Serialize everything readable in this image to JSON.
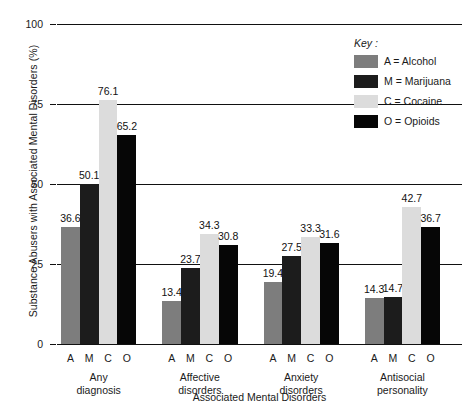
{
  "chart_data": {
    "type": "bar",
    "title": "",
    "xlabel": "Associated Mental Disorders",
    "ylabel": "Substance Abusers with Associated Mental Disorders (%)",
    "ylim": [
      0,
      100
    ],
    "yticks": [
      0,
      25,
      50,
      75,
      100
    ],
    "grid": true,
    "legend_position": "top-right",
    "legend_title": "Key :",
    "categories": [
      "Any diagnosis",
      "Affective disorders",
      "Anxiety disorders",
      "Antisocial personality"
    ],
    "category_lines": [
      [
        "Any",
        "diagnosis"
      ],
      [
        "Affective",
        "disorders"
      ],
      [
        "Anxiety",
        "disorders"
      ],
      [
        "Antisocial",
        "personality"
      ]
    ],
    "series": [
      {
        "name": "A = Alcohol",
        "letter": "A",
        "color": "#7d7d7d",
        "values": [
          36.6,
          13.4,
          19.4,
          14.3
        ]
      },
      {
        "name": "M = Marijuana",
        "letter": "M",
        "color": "#1c1c1c",
        "values": [
          50.1,
          23.7,
          27.5,
          14.7
        ]
      },
      {
        "name": "C = Cocaine",
        "letter": "C",
        "color": "#dcdcdc",
        "values": [
          76.1,
          34.3,
          33.3,
          42.7
        ]
      },
      {
        "name": "O = Opioids",
        "letter": "O",
        "color": "#060606",
        "values": [
          65.2,
          30.8,
          31.6,
          36.7
        ]
      }
    ]
  }
}
